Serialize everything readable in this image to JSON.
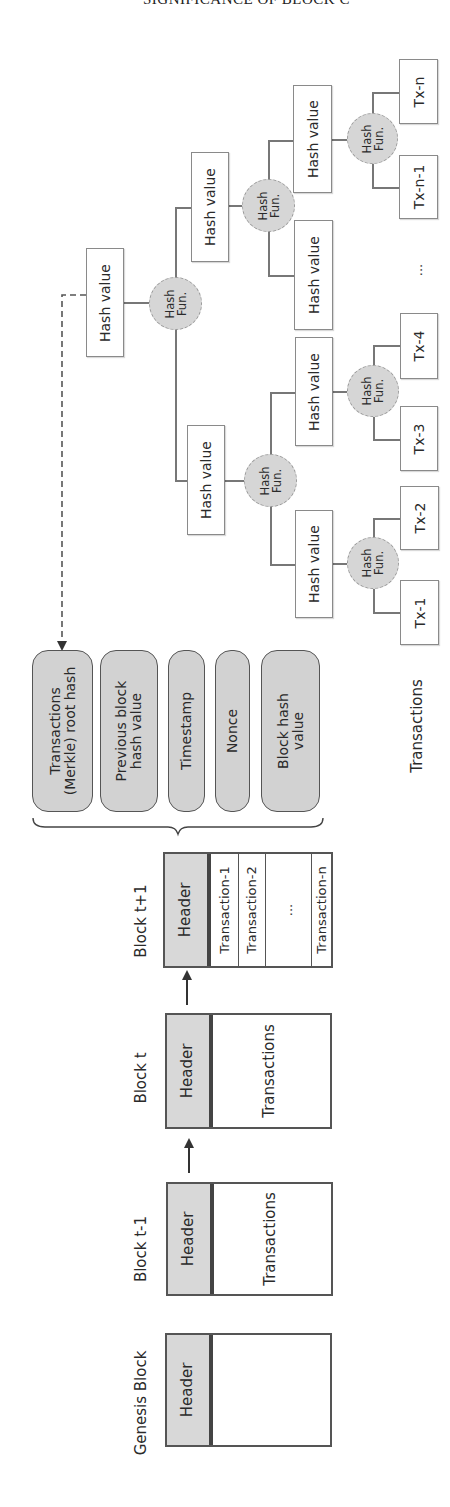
{
  "page_header": "SIGNIFICANCE OF BLOCK C",
  "merkle_tree": {
    "root": {
      "label": "Hash value"
    },
    "hash_fun_label": {
      "line1": "Hash",
      "line2": "Fun."
    },
    "level1": [
      {
        "label": "Hash value"
      },
      {
        "label": "Hash value"
      }
    ],
    "level2": [
      {
        "label": "Hash value"
      },
      {
        "label": "Hash value"
      },
      {
        "label": "Hash value"
      },
      {
        "label": "Hash value"
      }
    ],
    "transactions": [
      {
        "label": "Tx-1"
      },
      {
        "label": "Tx-2"
      },
      {
        "label": "Tx-3"
      },
      {
        "label": "Tx-4"
      },
      {
        "label": "Tx-n-1"
      },
      {
        "label": "Tx-n"
      }
    ],
    "ellipsis": "...",
    "transactions_label": "Transactions"
  },
  "header_fields": [
    {
      "line1": "Transactions",
      "line2": "(Merkle) root hash"
    },
    {
      "line1": "Previous block",
      "line2": "hash value"
    },
    {
      "line1": "Timestamp",
      "line2": ""
    },
    {
      "line1": "Nonce",
      "line2": ""
    },
    {
      "line1": "Block hash",
      "line2": "value"
    }
  ],
  "blocks": [
    {
      "label": "Block t+1",
      "header": "Header",
      "transactions": [
        "Transaction-1",
        "Transaction-2",
        "...",
        "Transaction-n"
      ]
    },
    {
      "label": "Block t",
      "header": "Header",
      "body": "Transactions"
    },
    {
      "label": "Block t-1",
      "header": "Header",
      "body": "Transactions"
    },
    {
      "label": "Genesis Block",
      "header": "Header",
      "body": ""
    }
  ],
  "colors": {
    "fill_gray": "#d6d6d6",
    "border": "#555555",
    "line": "#777777"
  }
}
